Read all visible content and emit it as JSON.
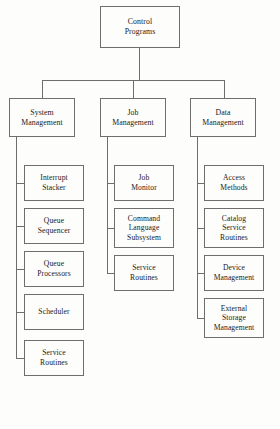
{
  "diagram": {
    "title": "Control Programs",
    "type": "organizational-hierarchy-chart",
    "orientation": "top-down",
    "background_color": "#fdfdfb",
    "line_color": "#6e6e6e",
    "text_color": "#1a1a1a"
  },
  "root": {
    "label": "Control\nPrograms",
    "x": 100,
    "y": 6,
    "w": 80,
    "h": 42
  },
  "level2": [
    {
      "label": "System\nManagement",
      "x": 9,
      "y": 98,
      "w": 66,
      "h": 39
    },
    {
      "label": "Job\nManagement",
      "x": 100,
      "y": 98,
      "w": 66,
      "h": 39
    },
    {
      "label": "Data\nManagement",
      "x": 190,
      "y": 98,
      "w": 66,
      "h": 39
    }
  ],
  "children": {
    "system_management": [
      {
        "label": "Interrupt\nStacker",
        "x": 24,
        "y": 165,
        "w": 60,
        "h": 36
      },
      {
        "label": "Queue\nSequencer",
        "x": 24,
        "y": 208,
        "w": 60,
        "h": 36
      },
      {
        "label": "Queue\nProcessors",
        "x": 24,
        "y": 251,
        "w": 60,
        "h": 36
      },
      {
        "label": "Scheduler",
        "x": 24,
        "y": 294,
        "w": 60,
        "h": 36
      },
      {
        "label": "Service\nRoutines",
        "x": 24,
        "y": 340,
        "w": 60,
        "h": 36
      }
    ],
    "job_management": [
      {
        "label": "Job\nMonitor",
        "x": 114,
        "y": 165,
        "w": 60,
        "h": 36
      },
      {
        "label": "Command\nLanguage\nSubsystem",
        "x": 114,
        "y": 208,
        "w": 60,
        "h": 40
      },
      {
        "label": "Service\nRoutines",
        "x": 114,
        "y": 255,
        "w": 60,
        "h": 36
      }
    ],
    "data_management": [
      {
        "label": "Access\nMethods",
        "x": 204,
        "y": 165,
        "w": 60,
        "h": 36
      },
      {
        "label": "Catalog\nService\nRoutines",
        "x": 204,
        "y": 208,
        "w": 60,
        "h": 40
      },
      {
        "label": "Device\nManagement",
        "x": 204,
        "y": 255,
        "w": 60,
        "h": 36
      },
      {
        "label": "External\nStorage\nManagement",
        "x": 204,
        "y": 298,
        "w": 60,
        "h": 40
      }
    ]
  },
  "connectors": {
    "root_stem": {
      "x": 139,
      "y": 48,
      "w": 1,
      "h": 32
    },
    "bus_level2": {
      "x": 42,
      "y": 80,
      "w": 183,
      "h": 1
    },
    "drop_system": {
      "x": 42,
      "y": 80,
      "w": 1,
      "h": 18
    },
    "drop_job": {
      "x": 133,
      "y": 80,
      "w": 1,
      "h": 18
    },
    "drop_data": {
      "x": 224,
      "y": 80,
      "w": 1,
      "h": 18
    },
    "spine_system": {
      "x": 16,
      "y": 137,
      "w": 1,
      "h": 221
    },
    "spine_job": {
      "x": 107,
      "y": 137,
      "w": 1,
      "h": 136
    },
    "spine_data": {
      "x": 197,
      "y": 137,
      "w": 1,
      "h": 181
    },
    "stub_len": 8
  }
}
